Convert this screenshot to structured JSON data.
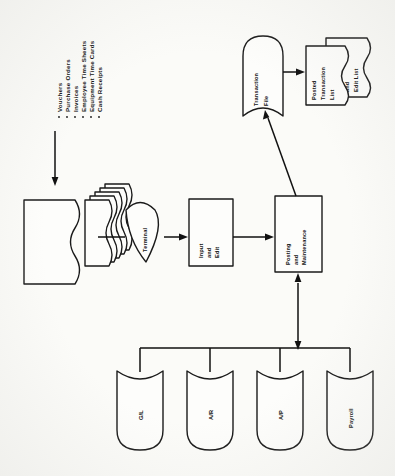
{
  "diagram": {
    "orientation": "rotated-90-ccw",
    "background_color": "#fbfbf8",
    "line_color": "#1a1a1a"
  },
  "source_documents": {
    "name": "source-document-list",
    "bullet_char": "·",
    "items": [
      "Vouchers",
      "Purchase Orders",
      "Invoices",
      "Employee Time Sheets",
      "Equipment Time Cards",
      "Cash Receipts"
    ]
  },
  "nodes": {
    "document_stack": {
      "label": "",
      "shape": "document-stack",
      "count": 6
    },
    "terminal": {
      "label": "Terminal",
      "shape": "display"
    },
    "input_edit": {
      "label_line1": "Input",
      "label_line2": "and",
      "label_line3": "Edit",
      "shape": "process"
    },
    "posting": {
      "label_line1": "Posting",
      "label_line2": "and",
      "label_line3": "Maintenance",
      "shape": "process"
    },
    "transaction_file": {
      "label_line1": "Transaction",
      "label_line2": "File",
      "shape": "stored-data"
    },
    "posted_transaction_list": {
      "label_line1": "Posted",
      "label_line2": "Transaction",
      "label_line3": "List",
      "shape": "document"
    },
    "errors_edit_list": {
      "label_line1": "Errors",
      "label_line2": "and",
      "label_line3": "Edit List",
      "shape": "document"
    }
  },
  "master_files": {
    "name": "master-file-row",
    "shape": "stored-data",
    "items": [
      {
        "label": "G/L"
      },
      {
        "label": "A/R"
      },
      {
        "label": "A/P"
      },
      {
        "label": "Payroll"
      }
    ]
  },
  "connectors": [
    {
      "from": "source-document-list",
      "to": "document-stack",
      "type": "arrow"
    },
    {
      "from": "document-stack",
      "to": "terminal",
      "type": "line"
    },
    {
      "from": "terminal",
      "to": "input-edit",
      "type": "arrow"
    },
    {
      "from": "input-edit",
      "to": "posting",
      "type": "arrow"
    },
    {
      "from": "posting",
      "to": "transaction-file",
      "type": "arrow-diagonal"
    },
    {
      "from": "transaction-file",
      "to": "posted-transaction-list",
      "type": "arrow"
    },
    {
      "from": "posting",
      "to": "master-file-bus",
      "type": "double-arrow"
    }
  ]
}
